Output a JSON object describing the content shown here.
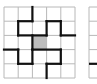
{
  "puzzle": {
    "grid_size": 5,
    "cell_px": 14.2,
    "origin": [
      4,
      7
    ],
    "colors": {
      "grid_line": "#b8b8b8",
      "path_line": "#111111",
      "shaded_cell": "#bdbdbd",
      "background": "#ffffff"
    },
    "shaded_cells": [
      [
        2,
        2
      ]
    ],
    "path_segments": [
      [
        [
          2,
          0
        ],
        [
          2,
          1
        ]
      ],
      [
        [
          1,
          1
        ],
        [
          2,
          1
        ]
      ],
      [
        [
          1,
          1
        ],
        [
          1,
          2
        ]
      ],
      [
        [
          1,
          2
        ],
        [
          3,
          2
        ]
      ],
      [
        [
          3,
          1
        ],
        [
          3,
          2
        ]
      ],
      [
        [
          3,
          1
        ],
        [
          4,
          1
        ]
      ],
      [
        [
          4,
          1
        ],
        [
          4,
          2
        ]
      ],
      [
        [
          4,
          2
        ],
        [
          5,
          2
        ]
      ],
      [
        [
          2,
          2
        ],
        [
          2,
          3
        ]
      ],
      [
        [
          0,
          3
        ],
        [
          1,
          3
        ]
      ],
      [
        [
          1,
          3
        ],
        [
          1,
          4
        ]
      ],
      [
        [
          1,
          4
        ],
        [
          2,
          4
        ]
      ],
      [
        [
          2,
          3
        ],
        [
          2,
          4
        ]
      ],
      [
        [
          2,
          3
        ],
        [
          4,
          3
        ]
      ],
      [
        [
          4,
          3
        ],
        [
          4,
          4
        ]
      ],
      [
        [
          3,
          4
        ],
        [
          4,
          4
        ]
      ],
      [
        [
          3,
          4
        ],
        [
          3,
          5
        ]
      ]
    ]
  },
  "second_grid": {
    "origin": [
      89,
      7
    ],
    "visible_columns": 1,
    "path_segments": [
      [
        [
          0,
          4
        ],
        [
          1,
          4
        ]
      ]
    ]
  }
}
